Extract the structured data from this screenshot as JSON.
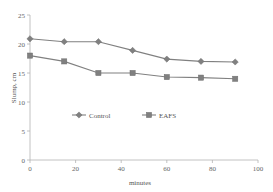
{
  "chart_data": {
    "type": "line",
    "title": "",
    "xlabel": "minutes",
    "ylabel": "Slump, cm",
    "xlim": [
      0,
      100
    ],
    "ylim": [
      0,
      25
    ],
    "xticks": [
      0,
      20,
      40,
      60,
      80,
      100
    ],
    "yticks": [
      0,
      5,
      10,
      15,
      20,
      25
    ],
    "xtick_labels": [
      "0",
      "20",
      "40",
      "60",
      "80",
      "100"
    ],
    "ytick_labels": [
      "0",
      "5",
      "10",
      "15",
      "20",
      "25"
    ],
    "grid": false,
    "legend_position": "inside-center",
    "x": [
      0,
      15,
      30,
      45,
      60,
      75,
      90
    ],
    "series": [
      {
        "name": "Control",
        "marker": "diamond",
        "color": "#808080",
        "values": [
          20.9,
          20.4,
          20.4,
          18.9,
          17.4,
          17.0,
          16.9
        ]
      },
      {
        "name": "EAFS",
        "marker": "square",
        "color": "#808080",
        "values": [
          18.0,
          17.0,
          15.0,
          15.0,
          14.3,
          14.2,
          14.0
        ]
      }
    ]
  },
  "axes": {
    "x_title": "minutes",
    "y_title": "Slump, cm"
  },
  "legend": {
    "entries": [
      {
        "label": "Control",
        "marker": "diamond"
      },
      {
        "label": "EAFS",
        "marker": "square"
      }
    ]
  }
}
